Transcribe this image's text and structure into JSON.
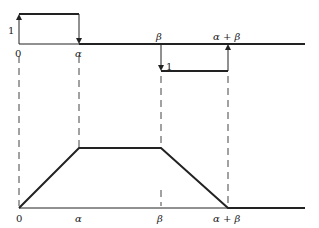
{
  "diagram": {
    "top_plot": {
      "x_labels": [
        "0",
        "α",
        "β",
        "α + β"
      ],
      "pulse_positive_label": "1",
      "pulse_negative_label": "1"
    },
    "bottom_plot": {
      "x_labels": [
        "0",
        "α",
        "β",
        "α + β"
      ],
      "shape": "trapezoid"
    }
  }
}
